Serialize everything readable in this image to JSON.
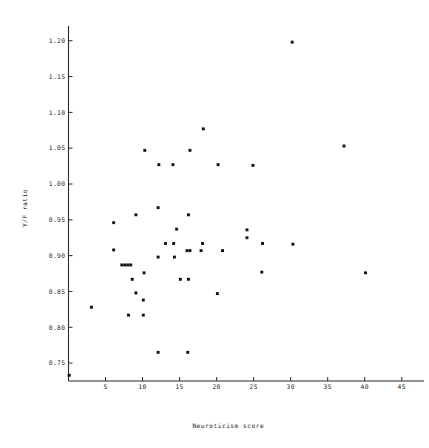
{
  "chart_data": {
    "type": "scatter",
    "title": "",
    "xlabel": "Neuroticism score",
    "ylabel": "Y/F ratio",
    "xlim": [
      0,
      48
    ],
    "ylim": [
      0.725,
      1.215
    ],
    "grid": false,
    "legend": null,
    "xticks": [
      5,
      10,
      15,
      20,
      25,
      30,
      35,
      40,
      45
    ],
    "xtick_labels": [
      "5",
      "10",
      "15",
      "20",
      "25",
      "30",
      "35",
      "40",
      "45"
    ],
    "yticks": [
      0.75,
      0.8,
      0.85,
      0.9,
      0.95,
      1.0,
      1.05,
      1.1,
      1.15,
      1.2
    ],
    "ytick_labels": [
      "0.75",
      "0.80",
      "0.85",
      "0.90",
      "0.95",
      "1.00",
      "1.05",
      "1.10",
      "1.15",
      "1.20"
    ],
    "marker": "square",
    "marker_color": "#111111",
    "points": [
      {
        "x": 30.2,
        "y": 1.198
      },
      {
        "x": 37.2,
        "y": 1.053
      },
      {
        "x": 18.2,
        "y": 1.077
      },
      {
        "x": 10.3,
        "y": 1.047
      },
      {
        "x": 16.4,
        "y": 1.047
      },
      {
        "x": 12.2,
        "y": 1.027
      },
      {
        "x": 14.1,
        "y": 1.027
      },
      {
        "x": 20.2,
        "y": 1.027
      },
      {
        "x": 24.9,
        "y": 1.026
      },
      {
        "x": 12.1,
        "y": 0.967
      },
      {
        "x": 9.1,
        "y": 0.957
      },
      {
        "x": 16.2,
        "y": 0.957
      },
      {
        "x": 6.1,
        "y": 0.946
      },
      {
        "x": 14.6,
        "y": 0.937
      },
      {
        "x": 24.1,
        "y": 0.936
      },
      {
        "x": 24.1,
        "y": 0.925
      },
      {
        "x": 13.1,
        "y": 0.917
      },
      {
        "x": 14.2,
        "y": 0.917
      },
      {
        "x": 18.1,
        "y": 0.917
      },
      {
        "x": 26.2,
        "y": 0.917
      },
      {
        "x": 30.3,
        "y": 0.916
      },
      {
        "x": 6.1,
        "y": 0.908
      },
      {
        "x": 16.0,
        "y": 0.907
      },
      {
        "x": 16.4,
        "y": 0.907
      },
      {
        "x": 17.9,
        "y": 0.907
      },
      {
        "x": 20.8,
        "y": 0.907
      },
      {
        "x": 12.1,
        "y": 0.898
      },
      {
        "x": 14.3,
        "y": 0.898
      },
      {
        "x": 7.2,
        "y": 0.887
      },
      {
        "x": 7.6,
        "y": 0.887
      },
      {
        "x": 8.0,
        "y": 0.887
      },
      {
        "x": 8.4,
        "y": 0.887
      },
      {
        "x": 26.1,
        "y": 0.877
      },
      {
        "x": 40.1,
        "y": 0.876
      },
      {
        "x": 10.2,
        "y": 0.876
      },
      {
        "x": 8.6,
        "y": 0.867
      },
      {
        "x": 15.1,
        "y": 0.867
      },
      {
        "x": 16.2,
        "y": 0.867
      },
      {
        "x": 9.1,
        "y": 0.848
      },
      {
        "x": 20.1,
        "y": 0.847
      },
      {
        "x": 10.1,
        "y": 0.838
      },
      {
        "x": 3.1,
        "y": 0.828
      },
      {
        "x": 8.1,
        "y": 0.817
      },
      {
        "x": 10.1,
        "y": 0.817
      },
      {
        "x": 12.1,
        "y": 0.765
      },
      {
        "x": 16.1,
        "y": 0.765
      },
      {
        "x": 0.1,
        "y": 0.733
      }
    ]
  }
}
